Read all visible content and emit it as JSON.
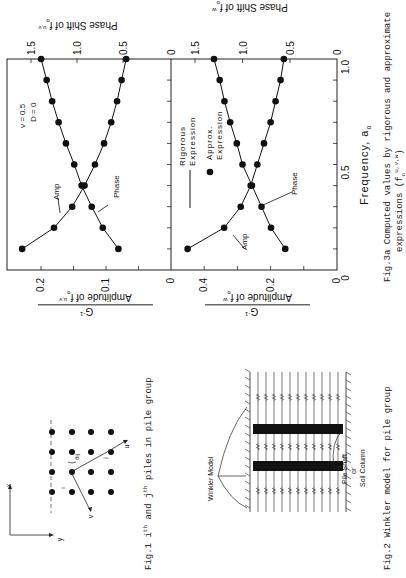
{
  "figures": {
    "fig1": {
      "caption_prefix": "Fig.1 i",
      "caption_sup1": "th",
      "caption_mid": " and j",
      "caption_sup2": "th",
      "caption_suffix": " piles in pile group",
      "axis_x": "x",
      "axis_y": "y",
      "label_i": "i",
      "label_j": "j",
      "label_u": "u",
      "label_v": "v",
      "label_theta": "θij",
      "grid_rows": 4,
      "grid_cols": 4
    },
    "fig2": {
      "caption": "Fig.2 Winkler model for pile group",
      "label_winkler": "Winkler Model",
      "label_pile_1": "Pile Shaft",
      "label_pile_2": "or",
      "label_pile_3": "Soil Column"
    },
    "fig3a": {
      "caption_line1": "Fig.3a Computed values by rigorous and approximate",
      "caption_line2": "expressions (f",
      "caption_line2_sup": "u,v,w",
      "caption_line2_sub": "o",
      "caption_line2_end": ")",
      "xlabel": "Frequency, a",
      "xlabel_sub": "o",
      "legend_rigorous_1": "Rigorous",
      "legend_rigorous_2": "Expression",
      "legend_approx_1": "Approx.",
      "legend_approx_2": "Expression",
      "params_line1": "ν = 0.5",
      "params_line2": "D = 0",
      "annot_amp": "Amp",
      "annot_phase": "Phase",
      "top_ylabel_amp": "Amplitude of f",
      "top_ylabel_amp_sup": "u,v",
      "top_ylabel_amp_sub": "o",
      "top_ylabel_amp_den": "G",
      "top_ylabel_amp_den_sup": "-1",
      "top_ylabel_phase": "Phase Shift of f",
      "top_ylabel_phase_sup": "u,v",
      "top_ylabel_phase_sub": "o",
      "bot_ylabel_amp": "Amplitude of f",
      "bot_ylabel_amp_sup": "w",
      "bot_ylabel_amp_sub": "o",
      "bot_ylabel_amp_den": "G",
      "bot_ylabel_amp_den_sup": "-1",
      "bot_ylabel_phase": "Phase Shift of f",
      "bot_ylabel_phase_sup": "w",
      "bot_ylabel_phase_sub": "o"
    }
  },
  "chart_data": [
    {
      "type": "line",
      "title": "Computed values by rigorous and approximate expressions (f_o^u,v)",
      "xlabel": "Frequency, a_o",
      "ylabel": "Amplitude of f_o^u,v / G^-1",
      "ylabel_secondary": "Phase Shift of f_o^u,v",
      "xlim": [
        0,
        1.0
      ],
      "ylim": [
        0,
        0.25
      ],
      "ylim_secondary": [
        0,
        1.6
      ],
      "xticks": [
        0,
        0.5,
        1.0
      ],
      "yticks": [
        0,
        0.1,
        0.2
      ],
      "yticks_secondary": [
        0.5,
        1.0,
        1.5
      ],
      "x": [
        0.1,
        0.2,
        0.3,
        0.4,
        0.5,
        0.6,
        0.7,
        0.8,
        0.9,
        1.0
      ],
      "series": [
        {
          "name": "Amp",
          "axis": "primary",
          "values": [
            0.229,
            0.18,
            0.152,
            0.133,
            0.117,
            0.103,
            0.092,
            0.083,
            0.076,
            0.069
          ]
        },
        {
          "name": "Phase",
          "axis": "secondary",
          "values": [
            0.55,
            0.72,
            0.84,
            0.95,
            1.03,
            1.12,
            1.2,
            1.27,
            1.33,
            1.39
          ]
        }
      ],
      "legend": [
        "Rigorous Expression (line)",
        "Approx. Expression (dots)"
      ],
      "annotations": [
        "ν = 0.5",
        "D = 0",
        "Amp",
        "Phase"
      ],
      "grid": false
    },
    {
      "type": "line",
      "title": "Computed values by rigorous and approximate expressions (f_o^w)",
      "xlabel": "Frequency, a_o",
      "ylabel": "Amplitude of f_o^w / G^-1",
      "ylabel_secondary": "Phase Shift of f_o^w",
      "xlim": [
        0,
        1.0
      ],
      "ylim": [
        0,
        0.5
      ],
      "ylim_secondary": [
        0,
        1.6
      ],
      "xticks": [
        0,
        0.5,
        1.0
      ],
      "yticks": [
        0,
        0.2,
        0.4
      ],
      "yticks_secondary": [
        0.5,
        1.0,
        1.5
      ],
      "x": [
        0.1,
        0.2,
        0.3,
        0.4,
        0.5,
        0.6,
        0.7,
        0.8,
        0.9,
        1.0
      ],
      "series": [
        {
          "name": "Amp",
          "axis": "primary",
          "values": [
            0.45,
            0.34,
            0.29,
            0.26,
            0.24,
            0.22,
            0.2,
            0.185,
            0.17,
            0.16
          ]
        },
        {
          "name": "Phase",
          "axis": "secondary",
          "values": [
            0.55,
            0.7,
            0.8,
            0.9,
            1.0,
            1.06,
            1.13,
            1.19,
            1.24,
            1.3
          ]
        }
      ],
      "legend": [
        "Rigorous Expression (line)",
        "Approx. Expression (dots)"
      ],
      "annotations": [
        "Amp",
        "Phase"
      ],
      "grid": false
    }
  ]
}
